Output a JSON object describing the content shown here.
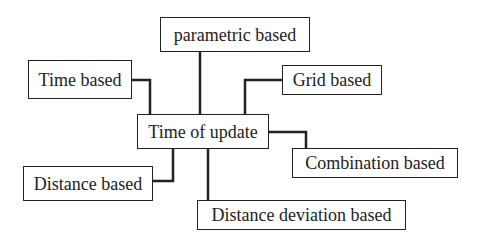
{
  "diagram": {
    "center": {
      "label": "Time of update"
    },
    "nodes": [
      {
        "id": "parametric",
        "label": "parametric based"
      },
      {
        "id": "time",
        "label": "Time based"
      },
      {
        "id": "grid",
        "label": "Grid based"
      },
      {
        "id": "combination",
        "label": "Combination based"
      },
      {
        "id": "distance",
        "label": "Distance based"
      },
      {
        "id": "distance-deviation",
        "label": "Distance deviation based"
      }
    ],
    "line_color": "#222222"
  }
}
